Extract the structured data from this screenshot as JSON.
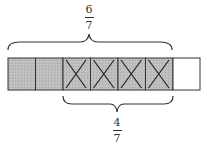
{
  "diagram": {
    "type": "fraction-bar",
    "total_parts": 7,
    "cells": [
      {
        "shaded": true,
        "crossed": false
      },
      {
        "shaded": true,
        "crossed": false
      },
      {
        "shaded": true,
        "crossed": true
      },
      {
        "shaded": true,
        "crossed": true
      },
      {
        "shaded": true,
        "crossed": true
      },
      {
        "shaded": true,
        "crossed": true
      },
      {
        "shaded": false,
        "crossed": false
      }
    ],
    "top_label": {
      "numerator": "6",
      "denominator": "7",
      "spans_cells": [
        1,
        6
      ]
    },
    "bottom_label": {
      "numerator": "4",
      "denominator": "7",
      "spans_cells": [
        3,
        6
      ]
    },
    "colors": {
      "shade": "#b8b8b8",
      "stroke": "#333333",
      "empty": "#ffffff"
    }
  }
}
